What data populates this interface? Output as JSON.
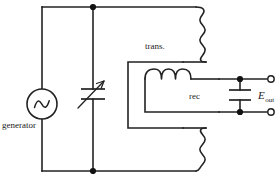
{
  "figure": {
    "name": "resonant-generator-transformer-rectifier-circuit",
    "background_color": "#ffffff",
    "line_color": "#222222",
    "width": 280,
    "height": 174
  },
  "labels": {
    "generator": "generator",
    "transformer": "trans.",
    "rectifier": "rec",
    "output_symbol": "E",
    "output_subscript": "out"
  },
  "components": {
    "source": {
      "name": "ac-generator",
      "symbol": "sine-wave-in-circle",
      "label": "generator"
    },
    "variable_capacitor": {
      "name": "variable-capacitor",
      "symbol": "two-plates-with-diagonal-arrow"
    },
    "transformer": {
      "name": "transformer",
      "label": "trans.",
      "primary_turns": 4,
      "secondary_turns": 4
    },
    "filter_inductor": {
      "name": "filter-inductor",
      "turns": 3
    },
    "filter_capacitor": {
      "name": "filter-capacitor",
      "symbol": "two-parallel-plates"
    },
    "output_terminals": {
      "name": "output-terminals",
      "count": 2,
      "label": "E_out"
    }
  }
}
